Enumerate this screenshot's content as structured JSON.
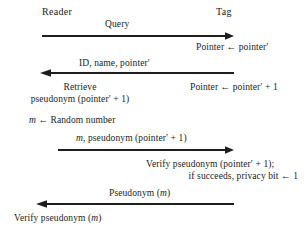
{
  "diagram": {
    "title_present": false,
    "type": "protocol-sequence-diagram",
    "ink_color": "#201d1d",
    "background_color": "#ffffff",
    "actors": [
      {
        "name": "reader",
        "label": "Reader"
      },
      {
        "name": "tag",
        "label": "Tag"
      }
    ],
    "messages": [
      {
        "name": "query",
        "label": "Query",
        "direction": "reader-to-tag"
      },
      {
        "name": "id-name-pointer",
        "label": "ID, name, pointer′",
        "direction": "tag-to-reader"
      },
      {
        "name": "m-pseudonym-pointer",
        "label": "m, pseudonym (pointer′ + 1)",
        "direction": "reader-to-tag"
      },
      {
        "name": "pseudonym-m",
        "label": "Pseudonym (m)",
        "direction": "tag-to-reader"
      }
    ],
    "notes": [
      {
        "name": "tag-pointer-assign",
        "side": "tag",
        "lines": [
          "Pointer ← pointer′"
        ]
      },
      {
        "name": "reader-retrieve-pseudonym",
        "side": "reader",
        "lines": [
          "Retrieve",
          "pseudonym (pointer′ + 1)"
        ]
      },
      {
        "name": "tag-pointer-increment",
        "side": "tag",
        "lines": [
          "Pointer ← pointer′ + 1"
        ]
      },
      {
        "name": "reader-random-number",
        "side": "reader",
        "lines": [
          "m ← Random number"
        ]
      },
      {
        "name": "tag-verify-pseudonym",
        "side": "tag",
        "lines": [
          "Verify pseudonym (pointer′ + 1);",
          "if succeeds, privacy bit ← 1"
        ]
      },
      {
        "name": "reader-verify-pseudonym",
        "side": "reader",
        "lines": [
          "Verify pseudonym (m)"
        ]
      }
    ],
    "symbols": {
      "left_arrow_assign": "←",
      "prime": "′",
      "variable_m": "m"
    }
  }
}
